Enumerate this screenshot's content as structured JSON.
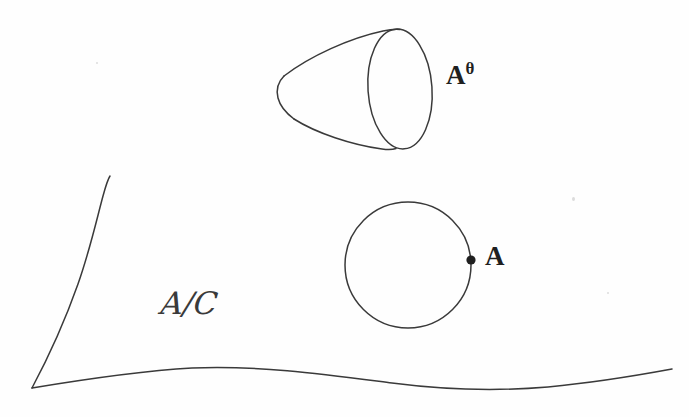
{
  "figure": {
    "kind": "hand-drawn-mathematical-diagram",
    "background_color": "#fefefe",
    "ink_color": "#3a3a3a",
    "label_color": "#1f1f1f",
    "labels": {
      "cone": "A",
      "cone_superscript": "θ",
      "point": "A",
      "surface_numerator": "A",
      "surface_slash": "/",
      "surface_denominator": "C"
    },
    "shapes": {
      "cone": {
        "name": "cone",
        "tip_x": 283,
        "tip_y": 88,
        "base_ellipse_cx": 400,
        "base_ellipse_cy": 89,
        "base_ellipse_rx": 32,
        "base_ellipse_ry": 60,
        "base_ellipse_rotation_deg": -4
      },
      "circle": {
        "name": "circle",
        "cx": 408,
        "cy": 265,
        "r": 63
      },
      "point": {
        "name": "marked-point",
        "cx": 472,
        "cy": 260,
        "r": 4.5
      },
      "surface": {
        "name": "surface-region",
        "vertex_x": 32,
        "vertex_y": 388,
        "left_edge_top_x": 110,
        "left_edge_top_y": 175,
        "bottom_right_end_x": 672,
        "bottom_right_end_y": 370
      }
    }
  }
}
